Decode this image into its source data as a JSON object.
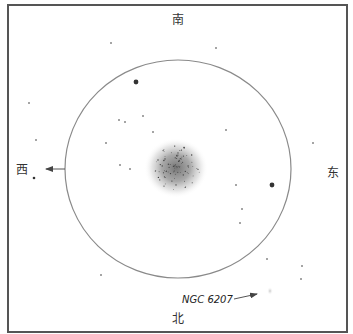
{
  "directions": {
    "south": "南",
    "north": "北",
    "west": "西",
    "east": "东"
  },
  "object_label": "NGC 6207",
  "colors": {
    "frame": "#555555",
    "fov_circle": "#8a8a8a",
    "star": "#333333",
    "cluster": "#777777"
  },
  "stars": [
    {
      "name": "star",
      "mag": "faint",
      "x": 111,
      "y": 43
    },
    {
      "name": "star",
      "mag": "faint",
      "x": 216,
      "y": 48
    },
    {
      "name": "star",
      "mag": "bright",
      "x": 136,
      "y": 82
    },
    {
      "name": "star",
      "mag": "faint",
      "x": 29,
      "y": 103
    },
    {
      "name": "star",
      "mag": "faint",
      "x": 143,
      "y": 116
    },
    {
      "name": "star",
      "mag": "faint",
      "x": 119,
      "y": 120
    },
    {
      "name": "star",
      "mag": "faint",
      "x": 125,
      "y": 122
    },
    {
      "name": "star",
      "mag": "faint",
      "x": 153,
      "y": 132
    },
    {
      "name": "star",
      "mag": "faint",
      "x": 226,
      "y": 130
    },
    {
      "name": "star",
      "mag": "faint",
      "x": 36,
      "y": 140
    },
    {
      "name": "star",
      "mag": "faint",
      "x": 106,
      "y": 143
    },
    {
      "name": "star",
      "mag": "faint",
      "x": 313,
      "y": 143
    },
    {
      "name": "star",
      "mag": "faint",
      "x": 120,
      "y": 165
    },
    {
      "name": "star",
      "mag": "faint",
      "x": 130,
      "y": 169
    },
    {
      "name": "star",
      "mag": "medium",
      "x": 34,
      "y": 178
    },
    {
      "name": "star",
      "mag": "faint",
      "x": 236,
      "y": 185
    },
    {
      "name": "star",
      "mag": "bright",
      "x": 272,
      "y": 185
    },
    {
      "name": "star",
      "mag": "faint",
      "x": 242,
      "y": 209
    },
    {
      "name": "star",
      "mag": "faint",
      "x": 240,
      "y": 223
    },
    {
      "name": "star",
      "mag": "faint",
      "x": 101,
      "y": 275
    },
    {
      "name": "star",
      "mag": "faint",
      "x": 267,
      "y": 259
    },
    {
      "name": "star",
      "mag": "faint",
      "x": 302,
      "y": 266
    },
    {
      "name": "star",
      "mag": "faint",
      "x": 301,
      "y": 279
    }
  ]
}
